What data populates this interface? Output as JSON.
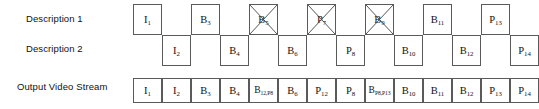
{
  "figure": {
    "type": "timeline-diagram",
    "rows": [
      {
        "id": "description-1",
        "label": "Description 1"
      },
      {
        "id": "description-2",
        "label": "Description 2"
      },
      {
        "id": "output-video-stream",
        "label": "Output Video Stream"
      }
    ]
  },
  "geometry": {
    "cell_width": 29,
    "cell_height": 31,
    "desc_row1_top": 4,
    "desc_row2_top": 35,
    "desc_origin_x": 133,
    "output_origin_x": 133,
    "output_top": 8,
    "output_cell_height": 25
  },
  "colors": {
    "stroke": "#5a5a5a",
    "cross_stroke": "#4a4a4a",
    "text": "#111111",
    "background": "#ffffff"
  },
  "description_1": {
    "label": "Description 1",
    "frames": [
      {
        "base": "I",
        "sub": "1",
        "slot": 0,
        "lost": false
      },
      {
        "base": "B",
        "sub": "3",
        "slot": 2,
        "lost": false
      },
      {
        "base": "B",
        "sub": "5",
        "slot": 4,
        "lost": true
      },
      {
        "base": "P",
        "sub": "7",
        "slot": 6,
        "lost": true
      },
      {
        "base": "B",
        "sub": "9",
        "slot": 8,
        "lost": true
      },
      {
        "base": "B",
        "sub": "11",
        "slot": 10,
        "lost": false
      },
      {
        "base": "P",
        "sub": "13",
        "slot": 12,
        "lost": false
      }
    ]
  },
  "description_2": {
    "label": "Description 2",
    "frames": [
      {
        "base": "I",
        "sub": "2",
        "slot": 1,
        "lost": false
      },
      {
        "base": "B",
        "sub": "4",
        "slot": 3,
        "lost": false
      },
      {
        "base": "B",
        "sub": "6",
        "slot": 5,
        "lost": false
      },
      {
        "base": "P",
        "sub": "8",
        "slot": 7,
        "lost": false
      },
      {
        "base": "B",
        "sub": "10",
        "slot": 9,
        "lost": false
      },
      {
        "base": "B",
        "sub": "12",
        "slot": 11,
        "lost": false
      },
      {
        "base": "P",
        "sub": "14",
        "slot": 13,
        "lost": false
      }
    ]
  },
  "output_video_stream": {
    "label": "Output Video Stream",
    "frames": [
      {
        "base": "I",
        "sub": "1"
      },
      {
        "base": "I",
        "sub": "2"
      },
      {
        "base": "B",
        "sub": "3"
      },
      {
        "base": "B",
        "sub": "4"
      },
      {
        "base": "B",
        "sub": "12,P8",
        "narrow": true
      },
      {
        "base": "B",
        "sub": "6"
      },
      {
        "base": "P",
        "sub": "12"
      },
      {
        "base": "P",
        "sub": "8"
      },
      {
        "base": "B",
        "sub": "P8,P13",
        "narrow": true
      },
      {
        "base": "B",
        "sub": "10"
      },
      {
        "base": "B",
        "sub": "11"
      },
      {
        "base": "B",
        "sub": "12"
      },
      {
        "base": "P",
        "sub": "13"
      },
      {
        "base": "P",
        "sub": "14"
      }
    ]
  }
}
